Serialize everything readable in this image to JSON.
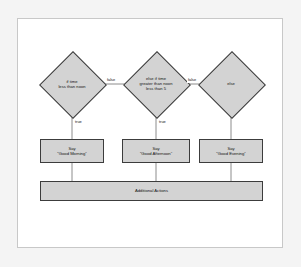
{
  "diagram": {
    "colors": {
      "node_fill": "#d3d3d3",
      "node_stroke": "#3c3c3c",
      "connector": "#6e6e6e",
      "canvas": "#ffffff",
      "frame_border": "#c8c8c8",
      "page_background": "#f4f4f4"
    },
    "decisions": [
      {
        "id": "if-time-less-than-noon",
        "line1": "if time",
        "line2": "less than noon",
        "line3": ""
      },
      {
        "id": "else-if-time-greater-than-noon-less-than-5",
        "line1": "else if time",
        "line2": "greater than noon",
        "line3": "less than 5"
      },
      {
        "id": "else",
        "line1": "else",
        "line2": "",
        "line3": ""
      }
    ],
    "actions": [
      {
        "id": "say-good-morning",
        "line1": "Say",
        "line2": "“Good Morning”"
      },
      {
        "id": "say-good-afternoon",
        "line1": "Say",
        "line2": "“Good Afternoon”"
      },
      {
        "id": "say-good-evening",
        "line1": "Say",
        "line2": "“Good Evening”"
      }
    ],
    "additional_actions": {
      "id": "additional-actions",
      "label": "Additional Actions"
    },
    "edge_labels": {
      "false_1": "false",
      "false_2": "false",
      "true_1": "true",
      "true_2": "true"
    }
  }
}
